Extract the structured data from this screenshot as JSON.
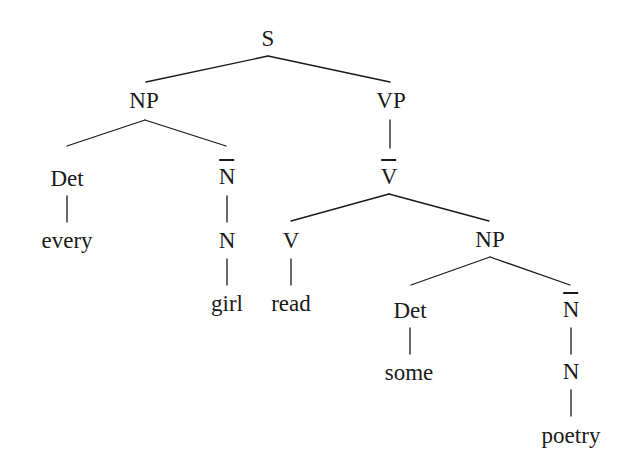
{
  "figure": {
    "kind": "syntax-tree",
    "background_color": "#ffffff",
    "line_color": "#1a1a1a",
    "text_color": "#1a1a1a",
    "width": 626,
    "height": 472
  },
  "sentence": "every girl read some poetry",
  "nodes": [
    {
      "id": "s",
      "label": "S",
      "type": "category",
      "bar": false,
      "x": 268,
      "y": 38
    },
    {
      "id": "np1",
      "label": "NP",
      "type": "category",
      "bar": false,
      "x": 144,
      "y": 100
    },
    {
      "id": "vp",
      "label": "VP",
      "type": "category",
      "bar": false,
      "x": 391,
      "y": 100
    },
    {
      "id": "det1",
      "label": "Det",
      "type": "category",
      "bar": false,
      "x": 67,
      "y": 178
    },
    {
      "id": "nbar1",
      "label": "N",
      "type": "category",
      "bar": true,
      "x": 227,
      "y": 176
    },
    {
      "id": "vbar",
      "label": "V",
      "type": "category",
      "bar": true,
      "x": 389,
      "y": 176
    },
    {
      "id": "every",
      "label": "every",
      "type": "word",
      "bar": false,
      "x": 67,
      "y": 240
    },
    {
      "id": "n1",
      "label": "N",
      "type": "category",
      "bar": false,
      "x": 227,
      "y": 240
    },
    {
      "id": "v",
      "label": "V",
      "type": "category",
      "bar": false,
      "x": 291,
      "y": 240
    },
    {
      "id": "np2",
      "label": "NP",
      "type": "category",
      "bar": false,
      "x": 490,
      "y": 239
    },
    {
      "id": "girl",
      "label": "girl",
      "type": "word",
      "bar": false,
      "x": 227,
      "y": 303
    },
    {
      "id": "read",
      "label": "read",
      "type": "word",
      "bar": false,
      "x": 291,
      "y": 303
    },
    {
      "id": "det2",
      "label": "Det",
      "type": "category",
      "bar": false,
      "x": 410,
      "y": 310
    },
    {
      "id": "nbar2",
      "label": "N",
      "type": "category",
      "bar": true,
      "x": 571,
      "y": 309
    },
    {
      "id": "some",
      "label": "some",
      "type": "word",
      "bar": false,
      "x": 409,
      "y": 372
    },
    {
      "id": "n2",
      "label": "N",
      "type": "category",
      "bar": false,
      "x": 571,
      "y": 371
    },
    {
      "id": "poetry",
      "label": "poetry",
      "type": "word",
      "bar": false,
      "x": 571,
      "y": 435
    }
  ],
  "edges": [
    {
      "id": "s-np1",
      "from": "s",
      "to": "np1",
      "x1": 268,
      "y1": 56,
      "x2": 146,
      "y2": 82
    },
    {
      "id": "s-vp",
      "from": "s",
      "to": "vp",
      "x1": 268,
      "y1": 56,
      "x2": 390,
      "y2": 82
    },
    {
      "id": "np1-det1",
      "from": "np1",
      "to": "det1",
      "x1": 145,
      "y1": 120,
      "x2": 67,
      "y2": 146
    },
    {
      "id": "np1-nbar1",
      "from": "np1",
      "to": "nbar1",
      "x1": 145,
      "y1": 120,
      "x2": 226,
      "y2": 146
    },
    {
      "id": "vp-vbar",
      "from": "vp",
      "to": "vbar",
      "x1": 390,
      "y1": 120,
      "x2": 390,
      "y2": 148
    },
    {
      "id": "det1-every",
      "from": "det1",
      "to": "every",
      "x1": 67,
      "y1": 196,
      "x2": 67,
      "y2": 222
    },
    {
      "id": "nbar1-n1",
      "from": "nbar1",
      "to": "n1",
      "x1": 227,
      "y1": 196,
      "x2": 227,
      "y2": 222
    },
    {
      "id": "vbar-v",
      "from": "vbar",
      "to": "v",
      "x1": 389,
      "y1": 194,
      "x2": 291,
      "y2": 221
    },
    {
      "id": "vbar-np2",
      "from": "vbar",
      "to": "np2",
      "x1": 389,
      "y1": 194,
      "x2": 489,
      "y2": 221
    },
    {
      "id": "n1-girl",
      "from": "n1",
      "to": "girl",
      "x1": 227,
      "y1": 259,
      "x2": 227,
      "y2": 285
    },
    {
      "id": "v-read",
      "from": "v",
      "to": "read",
      "x1": 291,
      "y1": 259,
      "x2": 291,
      "y2": 285
    },
    {
      "id": "np2-det2",
      "from": "np2",
      "to": "det2",
      "x1": 490,
      "y1": 257,
      "x2": 411,
      "y2": 285
    },
    {
      "id": "np2-nbar2",
      "from": "np2",
      "to": "nbar2",
      "x1": 490,
      "y1": 257,
      "x2": 570,
      "y2": 285
    },
    {
      "id": "det2-some",
      "from": "det2",
      "to": "some",
      "x1": 410,
      "y1": 328,
      "x2": 410,
      "y2": 354
    },
    {
      "id": "nbar2-n2",
      "from": "nbar2",
      "to": "n2",
      "x1": 571,
      "y1": 328,
      "x2": 571,
      "y2": 354
    },
    {
      "id": "n2-poetry",
      "from": "n2",
      "to": "poetry",
      "x1": 571,
      "y1": 390,
      "x2": 571,
      "y2": 416
    }
  ]
}
